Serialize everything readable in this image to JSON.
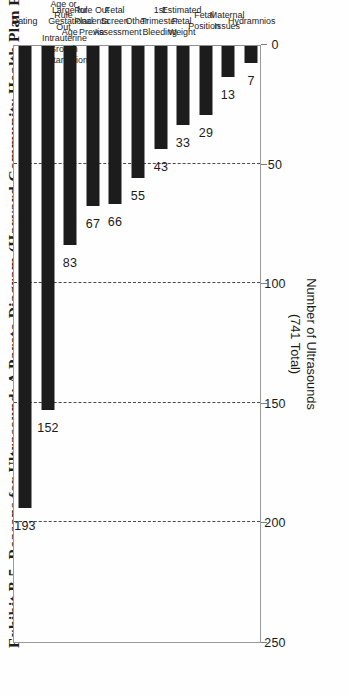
{
  "figure": {
    "title": "Exhibit B.5. Reasons for Ultrasound: A Pareto Diagram (Harvard Community Health Plan Project).",
    "axis_title_line1": "Number of Ultrasounds",
    "axis_title_line2": "(741 Total)"
  },
  "chart_data": {
    "type": "bar",
    "orientation": "vertical",
    "title": "Exhibit B.5. Reasons for Ultrasound: A Pareto Diagram (Harvard Community Health Plan Project).",
    "xlabel": "",
    "ylabel": "Number of Ultrasounds (741 Total)",
    "ylim": [
      0,
      250
    ],
    "yticks": [
      0,
      50,
      100,
      150,
      200,
      250
    ],
    "ytick_labels": [
      "0",
      "50",
      "100",
      "150",
      "200",
      "250"
    ],
    "grid": "dashed vertical gridlines at 50, 100, 150, 200",
    "legend": "none",
    "total": 741,
    "categories": [
      "Dating",
      "Small for Gestational Age or Rule Out Intrauterine Growth Retardation",
      "Large for Gestational Age",
      "Rule Out Placenta Previa",
      "Fetal Screen Assessment",
      "Other",
      "1st Trimester Bleeding",
      "Estimated Fetal Weight",
      "Fetal Position",
      "Maternal Issues",
      "Hydramnios"
    ],
    "category_lines": [
      [
        "Dating"
      ],
      [
        "Small for",
        "Gestational",
        "Age or Rule",
        "Out Intrauterine",
        "Growth Retardation"
      ],
      [
        "Large for",
        "Gestational",
        "Age"
      ],
      [
        "Rule Out",
        "Placenta",
        "Previa"
      ],
      [
        "Fetal",
        "Screen",
        "Assessment"
      ],
      [
        "Other"
      ],
      [
        "1st",
        "Trimester",
        "Bleeding"
      ],
      [
        "Estimated",
        "Fetal",
        "Weight"
      ],
      [
        "Fetal",
        "Position"
      ],
      [
        "Maternal",
        "Issues"
      ],
      [
        "Hydramnios"
      ]
    ],
    "values": [
      193,
      152,
      83,
      67,
      66,
      55,
      43,
      33,
      29,
      13,
      7
    ],
    "value_labels": [
      "193",
      "152",
      "83",
      "67",
      "66",
      "55",
      "43",
      "33",
      "29",
      "13",
      "7"
    ]
  },
  "colors": {
    "bar": "#1c1c1c",
    "grid": "#4a4a4a",
    "axis": "#8f8f8f",
    "text": "#1a1a1a",
    "background": "#fefefe"
  }
}
